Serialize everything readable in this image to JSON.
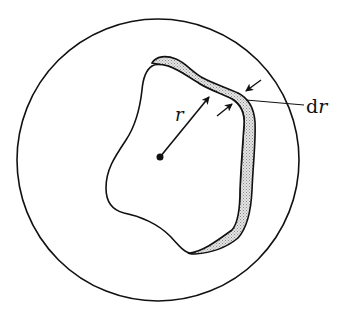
{
  "diagram": {
    "type": "geometric-figure",
    "labels": {
      "r": "r",
      "dr_prefix": "d",
      "dr_var": "r"
    },
    "elements": [
      {
        "name": "outer-circle",
        "shape": "circle"
      },
      {
        "name": "irregular-region",
        "shape": "closed-curve"
      },
      {
        "name": "shaded-shell",
        "shape": "band",
        "fill": "stippled-gray"
      },
      {
        "name": "center-point",
        "shape": "dot"
      },
      {
        "name": "radius-arrow",
        "label": "r"
      },
      {
        "name": "thickness-arrows",
        "label": "dr"
      }
    ],
    "colors": {
      "stroke": "#111111",
      "shell_fill": "#cfcfcf",
      "background": "#ffffff"
    }
  }
}
